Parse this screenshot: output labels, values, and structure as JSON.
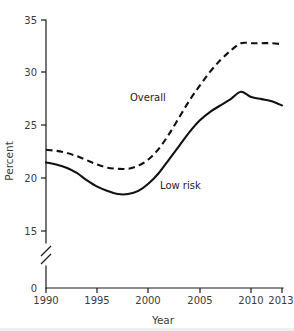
{
  "chart_data": {
    "type": "line",
    "title": "",
    "xlabel": "Year",
    "ylabel": "Percent",
    "xlim": [
      1990,
      2013
    ],
    "ylim": [
      15,
      35
    ],
    "y_axis_break": true,
    "y_axis_break_note": "axis broken between 0 and 15",
    "grid": false,
    "legend": "inline-annotations",
    "xticks": [
      "1990",
      "1995",
      "2000",
      "2005",
      "2010",
      "2013"
    ],
    "xtick_values": [
      1990,
      1995,
      2000,
      2005,
      2010,
      2013
    ],
    "yticks": [
      "0",
      "15",
      "20",
      "25",
      "30",
      "35"
    ],
    "ytick_values": [
      0,
      15,
      20,
      25,
      30,
      35
    ],
    "x": [
      1990,
      1991,
      1992,
      1993,
      1994,
      1995,
      1996,
      1997,
      1998,
      1999,
      2000,
      2001,
      2002,
      2003,
      2004,
      2005,
      2006,
      2007,
      2008,
      2009,
      2010,
      2011,
      2012,
      2013
    ],
    "series": [
      {
        "name": "Overall",
        "style": "dashed",
        "color": "#111111",
        "label_text": "Overall",
        "values": [
          22.7,
          22.6,
          22.4,
          22.1,
          21.7,
          21.3,
          21.0,
          20.9,
          20.9,
          21.2,
          21.8,
          22.8,
          24.2,
          25.8,
          27.4,
          28.8,
          30.1,
          31.2,
          32.1,
          32.8,
          32.8,
          32.8,
          32.8,
          32.7
        ]
      },
      {
        "name": "Low risk",
        "style": "solid",
        "color": "#111111",
        "label_text": "Low risk",
        "values": [
          21.5,
          21.3,
          21.0,
          20.5,
          19.8,
          19.2,
          18.8,
          18.5,
          18.5,
          18.8,
          19.5,
          20.5,
          21.8,
          23.1,
          24.4,
          25.5,
          26.3,
          26.9,
          27.5,
          28.2,
          27.7,
          27.5,
          27.3,
          26.9
        ]
      }
    ],
    "annotations": [
      {
        "text": "Overall",
        "x": 2000.5,
        "y": 28.4
      },
      {
        "text": "Low risk",
        "x": 2003.2,
        "y": 20.3
      }
    ]
  },
  "axis": {
    "y_label": "Percent",
    "x_label": "Year",
    "y_tick_0": "0",
    "y_tick_15": "15",
    "y_tick_20": "20",
    "y_tick_25": "25",
    "y_tick_30": "30",
    "y_tick_35": "35",
    "x_tick_1990": "1990",
    "x_tick_1995": "1995",
    "x_tick_2000": "2000",
    "x_tick_2005": "2005",
    "x_tick_2010": "2010",
    "x_tick_2013": "2013"
  },
  "series_labels": {
    "overall": "Overall",
    "low_risk": "Low risk"
  },
  "colors": {
    "line": "#111111",
    "axis": "#1a1a1a",
    "text": "#3b3b3b",
    "background": "#ffffff",
    "rule": "#efefef"
  }
}
